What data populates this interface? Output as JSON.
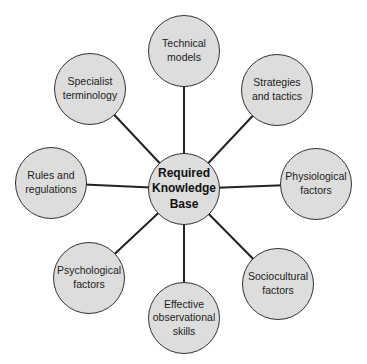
{
  "diagram": {
    "type": "hub-and-spoke",
    "line_color": "#222222",
    "node_fill": "#dddddd",
    "center": {
      "label": "Required\nKnowledge\nBase",
      "x": 184,
      "y": 189,
      "r": 36
    },
    "nodes": [
      {
        "id": "technical-models",
        "label": "Technical\nmodels",
        "x": 184,
        "y": 51,
        "r": 36
      },
      {
        "id": "strategies-tactics",
        "label": "Strategies\nand tactics",
        "x": 277,
        "y": 90,
        "r": 36
      },
      {
        "id": "physiological-factors",
        "label": "Physiological\nfactors",
        "x": 316,
        "y": 184,
        "r": 36
      },
      {
        "id": "sociocultural-factors",
        "label": "Sociocultural\nfactors",
        "x": 278,
        "y": 284,
        "r": 36
      },
      {
        "id": "effective-observational-skills",
        "label": "Effective\nobservational\nskills",
        "x": 184,
        "y": 318,
        "r": 36
      },
      {
        "id": "psychological-factors",
        "label": "Psychological\nfactors",
        "x": 89,
        "y": 278,
        "r": 36
      },
      {
        "id": "rules-regulations",
        "label": "Rules and\nregulations",
        "x": 51,
        "y": 183,
        "r": 36
      },
      {
        "id": "specialist-terminology",
        "label": "Specialist\nterminology",
        "x": 90,
        "y": 89,
        "r": 36
      }
    ]
  }
}
